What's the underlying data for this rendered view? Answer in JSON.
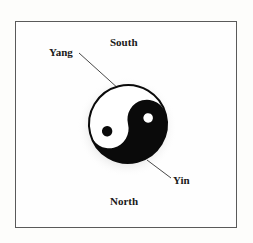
{
  "diagram": {
    "type": "taijitu-orientation",
    "labels": {
      "top": "South",
      "bottom": "North",
      "white_region": "Yang",
      "black_region": "Yin"
    },
    "colors": {
      "frame_border": "#5a5a5a",
      "yin": "#0a0a0a",
      "yang": "#ffffff",
      "leader_line": "#333333",
      "text": "#1a1a1a"
    },
    "symbol": {
      "center_x": 128,
      "center_y": 124,
      "radius": 39,
      "rotation_deg": -14
    }
  }
}
